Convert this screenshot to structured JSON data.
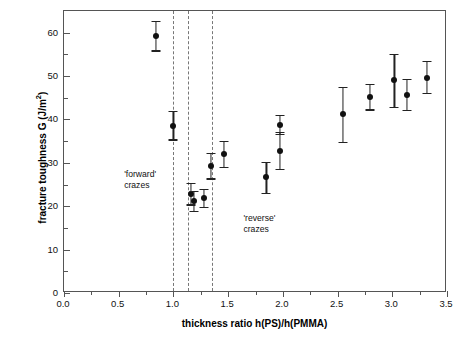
{
  "chart_data": {
    "type": "scatter",
    "title": "",
    "xlabel": "thickness ratio h(PS)/h(PMMA)",
    "ylabel_text": "fracture toughness G (J/m",
    "ylabel_sup": "2",
    "ylabel_tail": ")",
    "xlim": [
      0.0,
      3.5
    ],
    "ylim": [
      0,
      65
    ],
    "xticks": [
      "0.0",
      "0.5",
      "1.0",
      "1.5",
      "2.0",
      "2.5",
      "3.0",
      "3.5"
    ],
    "xtick_values": [
      0.0,
      0.5,
      1.0,
      1.5,
      2.0,
      2.5,
      3.0,
      3.5
    ],
    "xminor_values": [
      0.25,
      0.75,
      1.25,
      1.75,
      2.25,
      2.75,
      3.25
    ],
    "yticks": [
      "0",
      "10",
      "20",
      "30",
      "40",
      "50",
      "60"
    ],
    "ytick_values": [
      0,
      10,
      20,
      30,
      40,
      50,
      60
    ],
    "yminor_values": [
      5,
      15,
      25,
      35,
      45,
      55
    ],
    "grid": false,
    "legend": "none",
    "errorbar_style": "symmetric vertical with caps",
    "points": [
      {
        "x": 0.84,
        "y": 59.3,
        "yerr_lo": 3.4,
        "yerr_hi": 3.4
      },
      {
        "x": 1.0,
        "y": 38.6,
        "yerr_lo": 3.2,
        "yerr_hi": 3.4
      },
      {
        "x": 1.16,
        "y": 22.8,
        "yerr_lo": 2.4,
        "yerr_hi": 2.6
      },
      {
        "x": 1.19,
        "y": 21.2,
        "yerr_lo": 2.3,
        "yerr_hi": 2.4
      },
      {
        "x": 1.28,
        "y": 21.8,
        "yerr_lo": 2.0,
        "yerr_hi": 2.1
      },
      {
        "x": 1.34,
        "y": 29.3,
        "yerr_lo": 2.9,
        "yerr_hi": 2.9
      },
      {
        "x": 1.46,
        "y": 32.0,
        "yerr_lo": 3.0,
        "yerr_hi": 3.1
      },
      {
        "x": 1.85,
        "y": 26.7,
        "yerr_lo": 3.6,
        "yerr_hi": 3.6
      },
      {
        "x": 1.97,
        "y": 32.8,
        "yerr_lo": 4.3,
        "yerr_hi": 4.3
      },
      {
        "x": 1.97,
        "y": 38.8,
        "yerr_lo": 2.2,
        "yerr_hi": 2.2
      },
      {
        "x": 2.55,
        "y": 41.3,
        "yerr_lo": 6.4,
        "yerr_hi": 6.2
      },
      {
        "x": 2.8,
        "y": 45.2,
        "yerr_lo": 2.9,
        "yerr_hi": 3.0
      },
      {
        "x": 3.02,
        "y": 49.2,
        "yerr_lo": 6.4,
        "yerr_hi": 5.8
      },
      {
        "x": 3.13,
        "y": 45.7,
        "yerr_lo": 3.6,
        "yerr_hi": 3.7
      },
      {
        "x": 3.32,
        "y": 49.5,
        "yerr_lo": 3.4,
        "yerr_hi": 4.0
      }
    ],
    "vertical_dashed_lines": [
      1.0,
      1.13,
      1.35
    ],
    "annotations": [
      {
        "text": "'forward'\ncrazes",
        "x": 0.55,
        "y": 28.5
      },
      {
        "text": "'reverse'\ncrazes",
        "x": 1.64,
        "y": 18.5
      }
    ]
  }
}
